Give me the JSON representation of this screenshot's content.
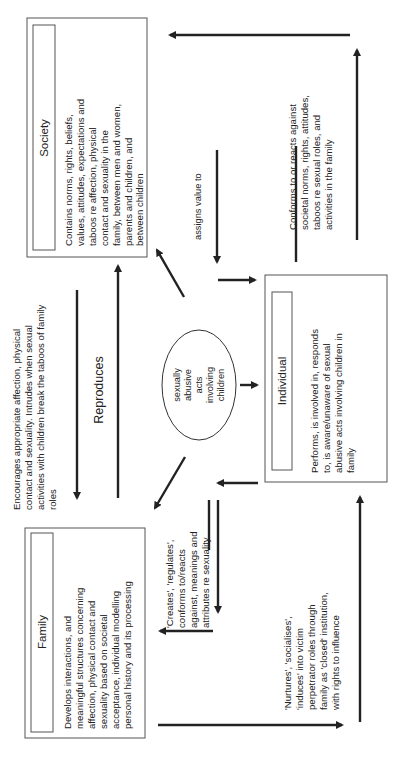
{
  "diagram": {
    "orientation": "rotated 90 degrees counter-clockwise",
    "nodes": {
      "society": {
        "title": "Society",
        "description": [
          "Contains norms, rights, beliefs,",
          "values, attitudes, expectations and",
          "taboos re affection, physical",
          "contact and sexuality in the",
          "family, between men and women,",
          "parents and children, and",
          "between children"
        ]
      },
      "family": {
        "title": "Family",
        "description": [
          "Develops interactions, and",
          "meaningful structures concerning",
          "affection, physical contact and",
          "sexuality based on societal",
          "acceptance, individual modelling",
          "personal history and its processing"
        ]
      },
      "individual": {
        "title": "Individual",
        "description": [
          "Performs, is involved in, responds",
          "to, is aware/unaware of sexual",
          "abusive acts involving children in",
          "family"
        ]
      },
      "center": {
        "lines": [
          "sexually",
          "abusive",
          "acts",
          "involving",
          "children"
        ]
      }
    },
    "edges": {
      "society_to_family": {
        "lines": [
          "Encourages  appropriate affection, physical",
          "contact and sexuality.  Intrudes when sexual",
          "activities with children  break the taboos of family",
          "roles"
        ]
      },
      "reproduces": {
        "label": "Reproduces"
      },
      "assigns_value": {
        "label": "assigns value to"
      },
      "individual_to_society": {
        "lines": [
          "Conforms to or  reacts against",
          "societal norms, rights, attitudes,",
          "taboos re sexual roles, and",
          "activities in the family"
        ]
      },
      "family_to_individual_creates": {
        "lines": [
          "'Creates', 'regulates',",
          "conforms to/reacts",
          "against, meanings and",
          "attributes re sexuality"
        ]
      },
      "family_to_individual_nurtures": {
        "lines": [
          "'Nurtures', 'socialises',",
          "'induces' into victim",
          "perpetrator roles through",
          "family as 'closed' institution,",
          "with rights to influence"
        ]
      }
    },
    "colors": {
      "line": "#222222",
      "box_border": "#555555",
      "background": "#ffffff"
    }
  }
}
